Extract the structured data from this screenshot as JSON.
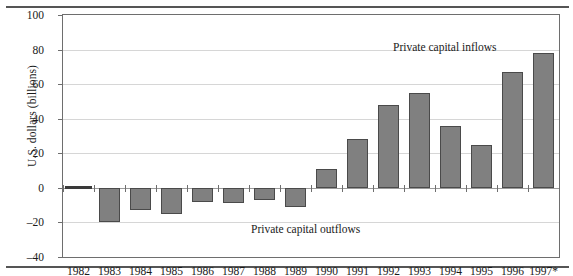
{
  "chart_data": {
    "type": "bar",
    "title": "",
    "xlabel": "",
    "ylabel": "U.S. dollars (billions)",
    "ylim": [
      -40,
      100
    ],
    "yticks": [
      100,
      80,
      60,
      40,
      20,
      0,
      -20,
      -40
    ],
    "ytick_labels": [
      "100",
      "80",
      "60",
      "40",
      "20",
      "0",
      "–20",
      "–40"
    ],
    "grid": true,
    "legend": "none",
    "categories": [
      "1982",
      "1983",
      "1984",
      "1985",
      "1986",
      "1987",
      "1988",
      "1989",
      "1990",
      "1991",
      "1992",
      "1993",
      "1994",
      "1995",
      "1996",
      "1997*"
    ],
    "values": [
      0,
      -20,
      -13,
      -15,
      -8,
      -9,
      -7,
      -11,
      11,
      28,
      48,
      55,
      36,
      25,
      67,
      78
    ],
    "annotations": [
      {
        "text": "Private capital inflows",
        "x": "1993",
        "y": 90
      },
      {
        "text": "Private capital outflows",
        "x": "1987",
        "y": -22
      }
    ],
    "bar_color": "#808080",
    "bar_edge_color": "#4a4a4a",
    "grid_color": "#d6d6d6",
    "axis_color": "#6e6e6e"
  },
  "annotations": {
    "inflows": "Private capital inflows",
    "outflows": "Private capital outflows"
  }
}
